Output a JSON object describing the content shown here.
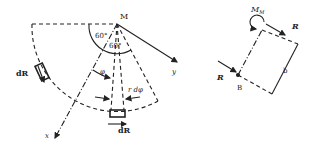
{
  "left_figure": {
    "point_label": "M",
    "angle_1": "60°",
    "angle_2": "60°",
    "phi_label": "φ",
    "rdphi_label": "r dφ",
    "force_left": "dR",
    "force_bottom": "dR",
    "axis_x": "x",
    "axis_y": "y"
  },
  "right_figure": {
    "moment_label": "M",
    "moment_sub": "M",
    "force_top": "R",
    "force_left": "R",
    "point_label": "B",
    "dimension_label": "b"
  },
  "colors": {
    "stroke": "#222222",
    "background": "#ffffff"
  }
}
